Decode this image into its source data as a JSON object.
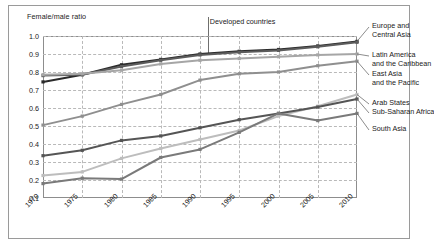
{
  "figure": {
    "y_axis_caption": "Female/male ratio",
    "annotation": "Developed countries"
  },
  "chart_data": {
    "type": "line",
    "title": "",
    "subtitle": "",
    "xlabel": "",
    "ylabel": "Female/male ratio",
    "x": [
      1970,
      1975,
      1980,
      1985,
      1990,
      1995,
      2000,
      2005,
      2010
    ],
    "xtick_labels": [
      "1970",
      "1975",
      "1980",
      "1985",
      "1990",
      "1995",
      "2000",
      "2005",
      "2010"
    ],
    "ytick_labels": [
      "0.1",
      "0.2",
      "0.3",
      "0.4",
      "0.5",
      "0.6",
      "0.7",
      "0.8",
      "0.9",
      "1.0"
    ],
    "ylim": [
      0.1,
      1.0
    ],
    "xlim": [
      1970,
      2010
    ],
    "grid": "dashed-both",
    "legend_position": "right-direct-labels",
    "annotations": [
      {
        "text": "Developed countries",
        "x": 1991,
        "y": 1.0
      }
    ],
    "series": [
      {
        "name": "Developed countries",
        "color": "#2b2b2b",
        "values": [
          0.745,
          0.785,
          0.84,
          0.87,
          0.9,
          0.915,
          0.925,
          0.945,
          0.97
        ]
      },
      {
        "name": "Europe and Central Asia",
        "color": "#5c5c5c",
        "values": [
          0.78,
          0.785,
          0.83,
          0.865,
          0.895,
          0.91,
          0.92,
          0.94,
          0.965
        ]
      },
      {
        "name": "Latin America and the Caribbean",
        "color": "#a6a6a6",
        "values": [
          0.785,
          0.79,
          0.81,
          0.845,
          0.865,
          0.875,
          0.885,
          0.895,
          0.9
        ]
      },
      {
        "name": "East Asia and the Pacific",
        "color": "#8f8f8f",
        "values": [
          0.505,
          0.555,
          0.62,
          0.675,
          0.755,
          0.79,
          0.8,
          0.835,
          0.86
        ]
      },
      {
        "name": "Arab States",
        "color": "#bdbdbd",
        "values": [
          0.225,
          0.245,
          0.32,
          0.375,
          0.425,
          0.475,
          0.555,
          0.61,
          0.675
        ]
      },
      {
        "name": "Sub-Saharan Africa",
        "color": "#555555",
        "values": [
          0.335,
          0.365,
          0.42,
          0.445,
          0.49,
          0.535,
          0.57,
          0.605,
          0.65
        ]
      },
      {
        "name": "South Asia",
        "color": "#7a7a7a",
        "values": [
          0.18,
          0.21,
          0.205,
          0.325,
          0.37,
          0.465,
          0.57,
          0.53,
          0.57
        ]
      }
    ]
  },
  "legend": [
    {
      "lines": [
        "Europe and",
        "Central Asia"
      ],
      "anchor_value": 0.97,
      "top": 22
    },
    {
      "lines": [
        "Latin America",
        "and the Caribbean"
      ],
      "anchor_value": 0.9,
      "top": 51
    },
    {
      "lines": [
        "East Asia",
        "and the Pacific"
      ],
      "anchor_value": 0.86,
      "top": 70
    },
    {
      "lines": [
        "Arab States"
      ],
      "anchor_value": 0.675,
      "top": 99
    },
    {
      "lines": [
        "Sub-Saharan Africa"
      ],
      "anchor_value": 0.65,
      "top": 108
    },
    {
      "lines": [
        "South Asia"
      ],
      "anchor_value": 0.57,
      "top": 125
    }
  ]
}
